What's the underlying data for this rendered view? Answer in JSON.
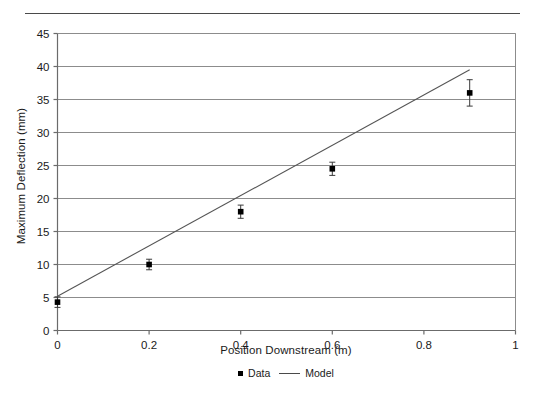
{
  "figure": {
    "has_top_rule": true,
    "background_color": "#ffffff"
  },
  "chart_data": {
    "type": "scatter",
    "title": "",
    "xlabel": "Position Downstream (m)",
    "ylabel": "Maximum Deflection (mm)",
    "xlim": [
      0,
      1
    ],
    "ylim": [
      0,
      45
    ],
    "xticks": [
      0,
      0.2,
      0.4,
      0.6,
      0.8,
      1
    ],
    "xtick_labels": [
      "0",
      "0.2",
      "0.4",
      "0.6",
      "0.8",
      "1"
    ],
    "yticks": [
      0,
      5,
      10,
      15,
      20,
      25,
      30,
      35,
      40,
      45
    ],
    "ytick_labels": [
      "0",
      "5",
      "10",
      "15",
      "20",
      "25",
      "30",
      "35",
      "40",
      "45"
    ],
    "grid": "horizontal",
    "legend_position": "bottom-center",
    "series": [
      {
        "name": "Data",
        "type": "scatter",
        "marker": "square",
        "color": "#000000",
        "x": [
          0,
          0.2,
          0.4,
          0.6,
          0.9
        ],
        "y": [
          4.3,
          10.0,
          18.0,
          24.5,
          36.0
        ],
        "yerr": [
          0.8,
          0.8,
          1.0,
          1.0,
          2.0
        ]
      },
      {
        "name": "Model",
        "type": "line",
        "color": "#555555",
        "x": [
          0,
          0.9
        ],
        "y": [
          5.2,
          39.5
        ]
      }
    ]
  },
  "legend": {
    "entries": [
      {
        "label": "Data",
        "swatch": "square-marker"
      },
      {
        "label": "Model",
        "swatch": "line-segment"
      }
    ]
  },
  "caption": {
    "text": ""
  }
}
